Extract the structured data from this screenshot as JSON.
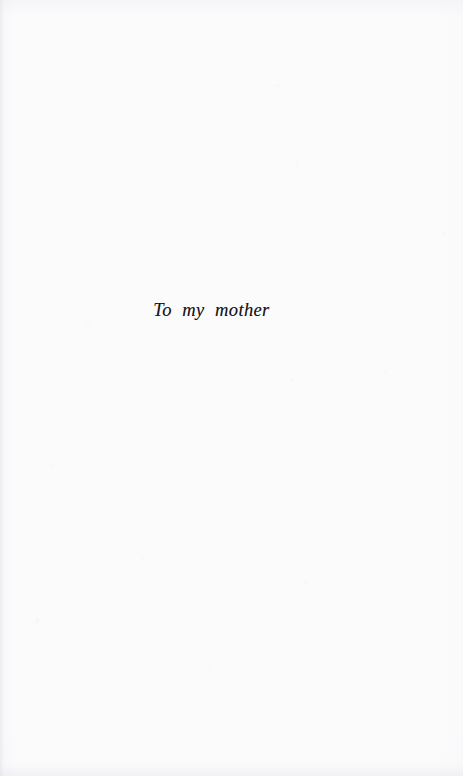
{
  "document": {
    "kind": "book-dedication-page",
    "page_width": 463,
    "page_height": 776,
    "paper_color": "#fbfbfc",
    "ink_color": "#16161a",
    "gutter_edge": "left"
  },
  "dedication": {
    "text": "To my mother",
    "style": "serif-italic",
    "alignment": "center",
    "approx_baseline_y": 320
  },
  "page_furniture": {
    "header": "",
    "footer": "",
    "folio": "",
    "running_head": ""
  }
}
